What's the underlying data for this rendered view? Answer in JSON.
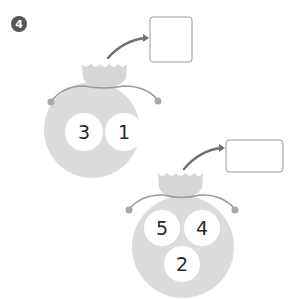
{
  "problem": {
    "number": "4",
    "badge_color": "#555555"
  },
  "colors": {
    "bag": "#dcdcdc",
    "bag_crown": "#d9d9d9",
    "string": "#9a9a9a",
    "arrow": "#707070",
    "box_border": "#999999",
    "ball": "#ffffff",
    "digit": "#2a2a2a"
  },
  "bags": [
    {
      "balls": [
        "3",
        "1"
      ],
      "answer_box": ""
    },
    {
      "balls": [
        "5",
        "4",
        "2"
      ],
      "answer_box": ""
    }
  ]
}
